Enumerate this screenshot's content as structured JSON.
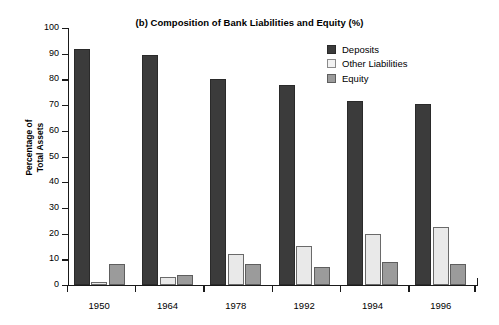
{
  "chart_data": {
    "type": "bar",
    "title": "(b) Composition of Bank Liabilities and Equity (%)",
    "xlabel": "",
    "ylabel": "Percentage of\nTotal Assets",
    "ylabel_line1": "Percentage of",
    "ylabel_line2": "Total Assets",
    "categories": [
      "1950",
      "1964",
      "1978",
      "1992",
      "1994",
      "1996"
    ],
    "ylim": [
      0,
      100
    ],
    "yticks": [
      0,
      10,
      20,
      30,
      40,
      50,
      60,
      70,
      80,
      90,
      100
    ],
    "ytick_labels": [
      "0",
      "10",
      "20",
      "30",
      "40",
      "50",
      "60",
      "70",
      "80",
      "90",
      "100"
    ],
    "grid": false,
    "legend_position": "top-right",
    "series": [
      {
        "name": "Deposits",
        "color": "#3b3b3b",
        "values": [
          92,
          89.5,
          80,
          78,
          71.5,
          70.5
        ]
      },
      {
        "name": "Other Liabilities",
        "color": "#e9e9e9",
        "values": [
          1,
          3,
          12,
          15,
          20,
          22.5
        ]
      },
      {
        "name": "Equity",
        "color": "#9b9b9b",
        "values": [
          8,
          4,
          8,
          7,
          9,
          8
        ]
      }
    ]
  }
}
